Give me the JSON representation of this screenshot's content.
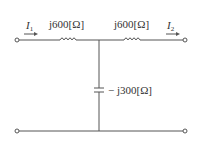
{
  "diagram": {
    "type": "two-port T-network circuit",
    "colors": {
      "wire": "#555555",
      "text": "#333333",
      "background": "#ffffff"
    },
    "labels": {
      "i1_main": "I",
      "i1_sub": "1",
      "i2_main": "I",
      "i2_sub": "2",
      "z1": "j600[Ω]",
      "z2": "j600[Ω]",
      "z3": "− j300[Ω]"
    },
    "components": [
      {
        "id": "L1",
        "kind": "inductor",
        "impedance": "j600[Ω]",
        "position": "top-left series"
      },
      {
        "id": "L2",
        "kind": "inductor",
        "impedance": "j600[Ω]",
        "position": "top-right series"
      },
      {
        "id": "C1",
        "kind": "capacitor",
        "impedance": "− j300[Ω]",
        "position": "shunt middle"
      }
    ],
    "terminals": [
      "top-left",
      "bottom-left",
      "top-right",
      "bottom-right"
    ],
    "currents": [
      {
        "name": "I1",
        "direction": "right",
        "position": "input top wire"
      },
      {
        "name": "I2",
        "direction": "right",
        "position": "output top wire"
      }
    ]
  }
}
